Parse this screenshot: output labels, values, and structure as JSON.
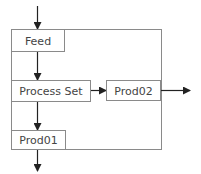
{
  "diagram": {
    "type": "flowchart",
    "colors": {
      "stroke": "#8a8a8a",
      "arrow": "#222222",
      "text": "#444444",
      "background": "#ffffff"
    },
    "nodes": [
      {
        "id": "feed",
        "label": "Feed"
      },
      {
        "id": "process_set",
        "label": "Process Set"
      },
      {
        "id": "prod02",
        "label": "Prod02"
      },
      {
        "id": "prod01",
        "label": "Prod01"
      }
    ],
    "edges": [
      {
        "from": "input",
        "to": "feed"
      },
      {
        "from": "feed",
        "to": "process_set"
      },
      {
        "from": "process_set",
        "to": "prod02"
      },
      {
        "from": "process_set",
        "to": "prod01"
      },
      {
        "from": "prod02",
        "to": "output"
      },
      {
        "from": "prod01",
        "to": "output"
      }
    ]
  }
}
